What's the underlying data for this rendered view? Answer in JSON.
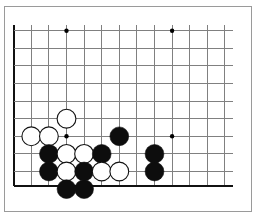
{
  "figure": {
    "kind": "go-board-diagram",
    "title": "",
    "caption": "",
    "frame_border_color": "#9a9a9a",
    "background_color": "#ffffff"
  },
  "board": {
    "label": "Go board corner diagram",
    "orientation": "lower-left corner",
    "grid_line_color": "#808080",
    "edge_line_color": "#111111",
    "grid_spacing_px": 17.6,
    "origin_x_px": 13.7,
    "origin_y_px": 30.7,
    "columns_visible": 13,
    "rows_visible": 9,
    "left_edge_is_board_edge": true,
    "bottom_edge_is_board_edge": true,
    "top_edge_is_board_edge": false,
    "right_edge_is_board_edge": false,
    "star_point_color": "#000000",
    "star_point_radius_px": 2.2,
    "star_points": [
      {
        "col": 4,
        "row": 1
      },
      {
        "col": 10,
        "row": 1
      },
      {
        "col": 4,
        "row": 7
      },
      {
        "col": 10,
        "row": 7
      }
    ]
  },
  "stones": {
    "black_fill": "#0d0d0d",
    "white_fill": "#ffffff",
    "outline_color": "#111111",
    "radius_px": 9.4,
    "outline_width_px": 1.1,
    "count_black": 10,
    "count_white": 8,
    "list": [
      {
        "color": "white",
        "col": 2,
        "row": 7
      },
      {
        "color": "white",
        "col": 3,
        "row": 7
      },
      {
        "color": "white",
        "col": 4,
        "row": 6
      },
      {
        "color": "black",
        "col": 7,
        "row": 7
      },
      {
        "color": "black",
        "col": 3,
        "row": 8
      },
      {
        "color": "white",
        "col": 4,
        "row": 8
      },
      {
        "color": "white",
        "col": 5,
        "row": 8
      },
      {
        "color": "black",
        "col": 6,
        "row": 8
      },
      {
        "color": "black",
        "col": 9,
        "row": 8
      },
      {
        "color": "black",
        "col": 3,
        "row": 9
      },
      {
        "color": "white",
        "col": 4,
        "row": 9
      },
      {
        "color": "black",
        "col": 5,
        "row": 9
      },
      {
        "color": "white",
        "col": 6,
        "row": 9
      },
      {
        "color": "white",
        "col": 7,
        "row": 9
      },
      {
        "color": "black",
        "col": 9,
        "row": 9
      },
      {
        "color": "black",
        "col": 4,
        "row": 10
      },
      {
        "color": "black",
        "col": 5,
        "row": 10
      }
    ]
  }
}
